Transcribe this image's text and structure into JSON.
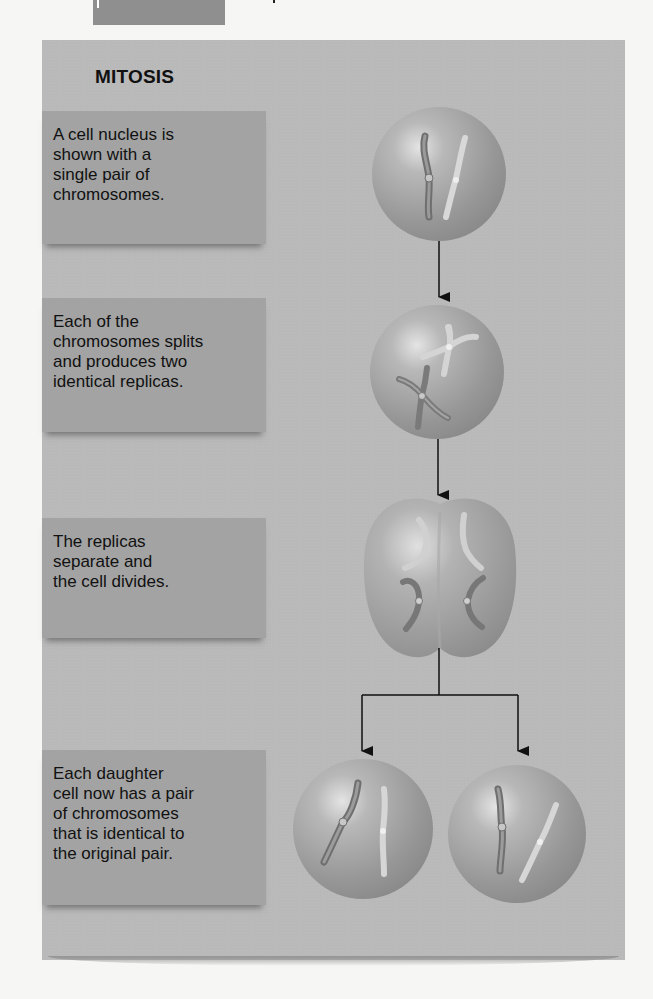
{
  "header": {
    "tab_color": "#8f8f8f"
  },
  "diagram": {
    "title": "MITOSIS",
    "panel_color": "#b9b9b9",
    "box_color": "#a3a3a3",
    "steps": [
      {
        "text": "A cell nucleus is\nshown with a\nsingle pair of\nchromosomes.",
        "image": "nucleus-with-chromosome-pair"
      },
      {
        "text": "Each of the\nchromosomes splits\nand produces two\nidentical replicas.",
        "image": "nucleus-with-replicated-chromosomes"
      },
      {
        "text": "The replicas\nseparate and\nthe cell divides.",
        "image": "dividing-cell"
      },
      {
        "text": "Each daughter\ncell now has a pair\nof chromosomes\nthat is identical to\nthe original pair.",
        "image": "two-daughter-cells"
      }
    ]
  }
}
